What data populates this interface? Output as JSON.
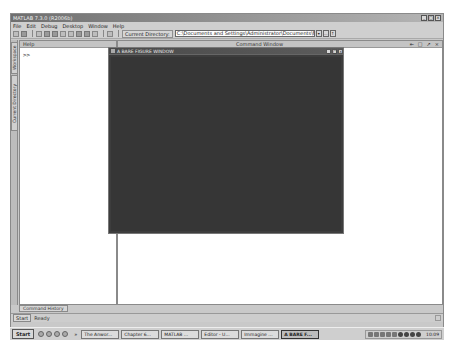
{
  "app": {
    "title": "MATLAB 7.3.0 (R2006b)",
    "window_controls": [
      "_",
      "□",
      "×"
    ]
  },
  "menubar": {
    "items": [
      "File",
      "Edit",
      "Debug",
      "Desktop",
      "Window",
      "Help"
    ]
  },
  "toolbar": {
    "icons": [
      "new-file-icon",
      "open-icon",
      "cut-icon",
      "copy-icon",
      "paste-icon",
      "undo-icon",
      "redo-icon",
      "simulink-icon",
      "guide-icon",
      "profiler-icon",
      "help-icon"
    ],
    "current_directory_label": "Current Directory:",
    "current_directory_value": "C:\\Documents and Settings\\Administrator\\Documents\\MATLAB",
    "dropdown_glyph": "▾",
    "browse_label": "...",
    "up_folder_glyph": "↑"
  },
  "left_tabs": {
    "workspace": "Workspace",
    "current_directory": "Current Directory"
  },
  "left_panel": {
    "header": "Help",
    "prompt": ">>"
  },
  "command_window": {
    "header": "Command Window",
    "header_buttons": [
      "⇤",
      "□",
      "↗",
      "×"
    ]
  },
  "figure_window": {
    "title": "A BARE FIGURE WINDOW",
    "controls": [
      "_",
      "□",
      "×"
    ],
    "background_color": "#363636"
  },
  "history_tabs": [
    "Command History"
  ],
  "statusbar": {
    "start_label": "Start",
    "status": "Ready"
  },
  "taskbar": {
    "start_label": "Start",
    "chevron": "»",
    "tasks": [
      {
        "label": "The Anwor...",
        "active": false
      },
      {
        "label": "Chapter 6...",
        "active": false
      },
      {
        "label": "MATLAB ...",
        "active": false
      },
      {
        "label": "Editor - U...",
        "active": false
      },
      {
        "label": "Immagine ...",
        "active": false
      },
      {
        "label": "A BARE F...",
        "active": true
      }
    ],
    "clock": "10:09"
  }
}
